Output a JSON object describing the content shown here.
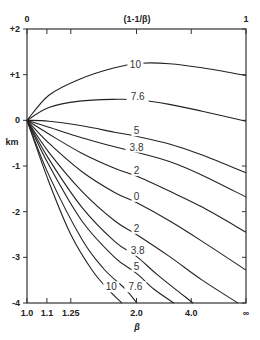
{
  "chart_data": {
    "type": "line",
    "title": "",
    "top_axis": {
      "label": "(1-1/β)",
      "ticks": [
        "0",
        "1"
      ],
      "range": [
        0,
        1
      ]
    },
    "xlabel": "β",
    "ylabel": "km",
    "x_ticks": [
      "1.0",
      "1.1",
      "1.25",
      "2.0",
      "4.0",
      "∞"
    ],
    "x_tick_beta": [
      1.0,
      1.1,
      1.25,
      2.0,
      4.0,
      "inf"
    ],
    "y_ticks": [
      "+2",
      "+1",
      "0",
      "-1",
      "-2",
      "-3",
      "-4"
    ],
    "y_tick_values": [
      2,
      1,
      0,
      -1,
      -2,
      -3,
      -4
    ],
    "ylim": [
      -4,
      2
    ],
    "xlim_transformed": [
      0,
      1
    ],
    "x_scale_note": "x positions are linear in (1-1/β)",
    "grid": false,
    "legend": "none (curves labeled inline)",
    "series": [
      {
        "name": "10 (upper)",
        "label": "10",
        "points": [
          [
            0,
            0
          ],
          [
            0.1,
            0.55
          ],
          [
            0.24,
            0.9
          ],
          [
            0.4,
            1.15
          ],
          [
            0.52,
            1.25
          ],
          [
            0.65,
            1.24
          ],
          [
            0.8,
            1.15
          ],
          [
            1.0,
            0.98
          ]
        ]
      },
      {
        "name": "7.6 (upper)",
        "label": "7.6",
        "points": [
          [
            0,
            0
          ],
          [
            0.1,
            0.28
          ],
          [
            0.24,
            0.42
          ],
          [
            0.4,
            0.46
          ],
          [
            0.5,
            0.45
          ],
          [
            0.65,
            0.35
          ],
          [
            0.8,
            0.2
          ],
          [
            1.0,
            -0.02
          ]
        ]
      },
      {
        "name": "5 (upper)",
        "label": "5",
        "points": [
          [
            0,
            0
          ],
          [
            0.1,
            -0.02
          ],
          [
            0.25,
            -0.12
          ],
          [
            0.4,
            -0.26
          ],
          [
            0.5,
            -0.35
          ],
          [
            0.65,
            -0.52
          ],
          [
            0.8,
            -0.76
          ],
          [
            1.0,
            -1.15
          ]
        ]
      },
      {
        "name": "3.8 (upper)",
        "label": "3.8",
        "points": [
          [
            0,
            0
          ],
          [
            0.1,
            -0.15
          ],
          [
            0.25,
            -0.38
          ],
          [
            0.4,
            -0.58
          ],
          [
            0.5,
            -0.7
          ],
          [
            0.65,
            -0.9
          ],
          [
            0.8,
            -1.2
          ],
          [
            1.0,
            -1.68
          ]
        ]
      },
      {
        "name": "2 (upper)",
        "label": "2",
        "points": [
          [
            0,
            0
          ],
          [
            0.1,
            -0.3
          ],
          [
            0.25,
            -0.72
          ],
          [
            0.4,
            -1.05
          ],
          [
            0.5,
            -1.22
          ],
          [
            0.65,
            -1.55
          ],
          [
            0.8,
            -1.9
          ],
          [
            1.0,
            -2.45
          ]
        ]
      },
      {
        "name": "0",
        "label": "0",
        "points": [
          [
            0,
            0
          ],
          [
            0.1,
            -0.5
          ],
          [
            0.25,
            -1.12
          ],
          [
            0.4,
            -1.58
          ],
          [
            0.5,
            -1.8
          ],
          [
            0.65,
            -2.2
          ],
          [
            0.8,
            -2.65
          ],
          [
            1.0,
            -3.28
          ]
        ]
      },
      {
        "name": "2 (lower)",
        "label": "2",
        "points": [
          [
            0,
            0
          ],
          [
            0.1,
            -0.7
          ],
          [
            0.25,
            -1.55
          ],
          [
            0.4,
            -2.2
          ],
          [
            0.5,
            -2.5
          ],
          [
            0.65,
            -2.98
          ],
          [
            0.8,
            -3.5
          ],
          [
            0.963,
            -4.0
          ]
        ]
      },
      {
        "name": "3.8 (lower)",
        "label": "3.8",
        "points": [
          [
            0,
            0
          ],
          [
            0.1,
            -0.85
          ],
          [
            0.25,
            -1.9
          ],
          [
            0.4,
            -2.65
          ],
          [
            0.5,
            -2.98
          ],
          [
            0.6,
            -3.4
          ],
          [
            0.758,
            -4.0
          ]
        ]
      },
      {
        "name": "5 (lower)",
        "label": "5",
        "points": [
          [
            0,
            0
          ],
          [
            0.1,
            -0.98
          ],
          [
            0.25,
            -2.2
          ],
          [
            0.4,
            -3.0
          ],
          [
            0.5,
            -3.35
          ],
          [
            0.58,
            -3.7
          ],
          [
            0.671,
            -4.0
          ]
        ]
      },
      {
        "name": "7.6 (lower)",
        "label": "7.6",
        "points": [
          [
            0,
            0
          ],
          [
            0.1,
            -1.2
          ],
          [
            0.25,
            -2.6
          ],
          [
            0.35,
            -3.25
          ],
          [
            0.45,
            -3.7
          ],
          [
            0.502,
            -4.0
          ]
        ]
      },
      {
        "name": "10 (lower)",
        "label": "10",
        "points": [
          [
            0,
            0
          ],
          [
            0.1,
            -1.35
          ],
          [
            0.2,
            -2.5
          ],
          [
            0.3,
            -3.3
          ],
          [
            0.38,
            -3.75
          ],
          [
            0.434,
            -4.0
          ]
        ]
      }
    ],
    "inline_labels": [
      {
        "text": "10",
        "x": 0.495,
        "y": 1.16
      },
      {
        "text": "7.6",
        "x": 0.505,
        "y": 0.46
      },
      {
        "text": "5",
        "x": 0.5,
        "y": -0.28
      },
      {
        "text": "3.8",
        "x": 0.5,
        "y": -0.64
      },
      {
        "text": "2",
        "x": 0.5,
        "y": -1.15
      },
      {
        "text": "0",
        "x": 0.5,
        "y": -1.72
      },
      {
        "text": "2",
        "x": 0.5,
        "y": -2.42
      },
      {
        "text": "3.8",
        "x": 0.505,
        "y": -2.9
      },
      {
        "text": "5",
        "x": 0.5,
        "y": -3.25
      },
      {
        "text": "7.6",
        "x": 0.495,
        "y": -3.7
      },
      {
        "text": "10",
        "x": 0.385,
        "y": -3.7
      }
    ]
  },
  "labels": {
    "top_axis_left": "0",
    "top_axis_title": "(1-1/β)",
    "top_axis_right": "1",
    "y_axis_title": "km",
    "x_axis_title": "β"
  }
}
